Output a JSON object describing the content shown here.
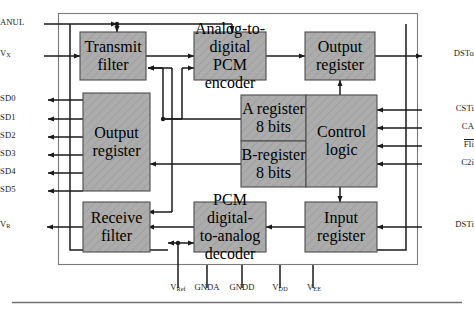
{
  "figure": {
    "type": "block-diagram",
    "chip_fill": "#a9a9a9",
    "chip_border": "#4d4d4d",
    "line_color": "#1a1a1a",
    "background": "#ffffff"
  },
  "blocks": [
    {
      "id": "transmit_filter",
      "line1": "Transmit",
      "line2": "filter",
      "line3": ""
    },
    {
      "id": "adc_encoder",
      "line1": "Analog-to-",
      "line2": "digital PCM",
      "line3": "encoder"
    },
    {
      "id": "output_register_right",
      "line1": "Output",
      "line2": "register",
      "line3": ""
    },
    {
      "id": "output_register_left",
      "line1": "Output",
      "line2": "register",
      "line3": ""
    },
    {
      "id": "a_register",
      "line1": "A register",
      "line2": "8 bits",
      "line3": ""
    },
    {
      "id": "b_register",
      "line1": "B-register",
      "line2": "8 bits",
      "line3": ""
    },
    {
      "id": "control_logic",
      "line1": "Control",
      "line2": "logic",
      "line3": ""
    },
    {
      "id": "receive_filter",
      "line1": "Receive",
      "line2": "filter",
      "line3": ""
    },
    {
      "id": "dac_decoder",
      "line1": "PCM digital-",
      "line2": "to-analog",
      "line3": "decoder"
    },
    {
      "id": "input_register",
      "line1": "Input",
      "line2": "register",
      "line3": ""
    }
  ],
  "pins": {
    "left": [
      {
        "id": "anul",
        "label": "ANUL",
        "sub": "",
        "direction": "in"
      },
      {
        "id": "vx",
        "label": "V",
        "sub": "X",
        "direction": "in"
      },
      {
        "id": "sd0",
        "label": "SD0",
        "sub": "",
        "direction": "out"
      },
      {
        "id": "sd1",
        "label": "SD1",
        "sub": "",
        "direction": "out"
      },
      {
        "id": "sd2",
        "label": "SD2",
        "sub": "",
        "direction": "out"
      },
      {
        "id": "sd3",
        "label": "SD3",
        "sub": "",
        "direction": "out"
      },
      {
        "id": "sd4",
        "label": "SD4",
        "sub": "",
        "direction": "out"
      },
      {
        "id": "sd5",
        "label": "SD5",
        "sub": "",
        "direction": "out"
      },
      {
        "id": "vr",
        "label": "V",
        "sub": "R",
        "direction": "out"
      }
    ],
    "right": [
      {
        "id": "dsto",
        "label": "DSTo",
        "sub": "",
        "overbar": false,
        "direction": "out"
      },
      {
        "id": "csti",
        "label": "CSTi",
        "sub": "",
        "overbar": false,
        "direction": "in"
      },
      {
        "id": "ca",
        "label": "CA",
        "sub": "",
        "overbar": false,
        "direction": "in"
      },
      {
        "id": "fli",
        "label": "FIi",
        "sub": "",
        "overbar": true,
        "direction": "in"
      },
      {
        "id": "c2i",
        "label": "C2i",
        "sub": "",
        "overbar": false,
        "direction": "in"
      },
      {
        "id": "dsti",
        "label": "DSTi",
        "sub": "",
        "overbar": false,
        "direction": "in"
      }
    ],
    "bottom": [
      {
        "id": "vref",
        "label": "V",
        "sub": "Ref"
      },
      {
        "id": "gnda",
        "label": "GNDA",
        "sub": ""
      },
      {
        "id": "gndd",
        "label": "GNDD",
        "sub": ""
      },
      {
        "id": "vdd",
        "label": "V",
        "sub": "DD"
      },
      {
        "id": "vee",
        "label": "V",
        "sub": "EE"
      }
    ]
  }
}
